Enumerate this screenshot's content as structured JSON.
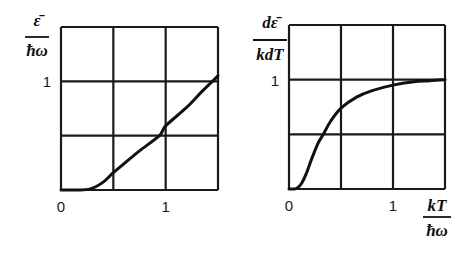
{
  "chart_data": [
    {
      "type": "line",
      "title": "",
      "xlabel": "",
      "ylabel": "ε̄ / ħω",
      "ylabel_numerator": "ε̄",
      "ylabel_denominator": "ħω",
      "xlim": [
        0,
        1.5
      ],
      "ylim": [
        0,
        1.5
      ],
      "grid": true,
      "grid_step": 0.5,
      "x_ticks": [
        {
          "value": 0,
          "label": "0"
        },
        {
          "value": 1,
          "label": "1"
        }
      ],
      "y_ticks": [
        {
          "value": 1,
          "label": "1"
        }
      ],
      "series": [
        {
          "name": "mean energy",
          "x": [
            0,
            0.15,
            0.28,
            0.4,
            0.5,
            0.6,
            0.75,
            0.94,
            1.0,
            1.2,
            1.35,
            1.5
          ],
          "y": [
            0,
            0.0,
            0.01,
            0.07,
            0.16,
            0.24,
            0.36,
            0.5,
            0.59,
            0.76,
            0.91,
            1.05
          ]
        }
      ]
    },
    {
      "type": "line",
      "title": "",
      "xlabel": "kT / ħω",
      "xlabel_numerator": "kT",
      "xlabel_denominator": "ħω",
      "ylabel": "dε̄ / kdT",
      "ylabel_numerator": "dε̄",
      "ylabel_denominator": "kdT",
      "xlim": [
        0,
        1.5
      ],
      "ylim": [
        0,
        1.5
      ],
      "grid": true,
      "grid_step": 0.5,
      "x_ticks": [
        {
          "value": 0,
          "label": "0"
        },
        {
          "value": 1,
          "label": "1"
        }
      ],
      "y_ticks": [
        {
          "value": 1,
          "label": "1"
        }
      ],
      "series": [
        {
          "name": "heat capacity",
          "x": [
            0,
            0.05,
            0.08,
            0.12,
            0.17,
            0.22,
            0.28,
            0.33,
            0.4,
            0.5,
            0.65,
            0.8,
            1.0,
            1.2,
            1.35,
            1.5
          ],
          "y": [
            0,
            0.0,
            0.01,
            0.05,
            0.15,
            0.28,
            0.42,
            0.5,
            0.62,
            0.74,
            0.84,
            0.9,
            0.95,
            0.98,
            0.99,
            1.0
          ]
        }
      ]
    }
  ],
  "layout": {
    "panels": [
      {
        "x0": 61,
        "x1": 218,
        "y0": 190,
        "y1": 27,
        "ylabel_x": 37,
        "ylabel_num_y": 26,
        "ylabel_bar_y": 37,
        "ylabel_den_y": 56
      },
      {
        "x0": 289,
        "x1": 445,
        "y0": 189,
        "y1": 25,
        "ylabel_x": 270,
        "ylabel_num_y": 28,
        "ylabel_bar_y": 40,
        "ylabel_den_y": 60
      }
    ]
  }
}
